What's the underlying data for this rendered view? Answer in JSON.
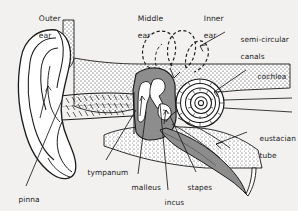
{
  "figure": {
    "kind": "anatomical-diagram",
    "background_color": "#f2f1ef",
    "ink_color": "#1b1b1b",
    "cavity_fill": "#8d8d8d",
    "bone_stipple_fill": "#d8d8d8",
    "bone_white_fill": "#ffffff"
  },
  "headings": [
    {
      "id": "outer",
      "line1": "Outer",
      "line2": "ear"
    },
    {
      "id": "middle",
      "line1": "Middle",
      "line2": "ear"
    },
    {
      "id": "inner",
      "line1": "Inner",
      "line2": "ear"
    }
  ],
  "labels": [
    {
      "id": "semicircular-canals",
      "line1": "semi-circular",
      "line2": "canals"
    },
    {
      "id": "cochlea",
      "line1": "cochlea",
      "line2": ""
    },
    {
      "id": "eustacian-tube",
      "line1": "eustacian",
      "line2": "tube"
    },
    {
      "id": "tympanum",
      "line1": "tympanum",
      "line2": ""
    },
    {
      "id": "malleus",
      "line1": "malleus",
      "line2": ""
    },
    {
      "id": "incus",
      "line1": "incus",
      "line2": ""
    },
    {
      "id": "stapes",
      "line1": "stapes",
      "line2": ""
    },
    {
      "id": "pinna",
      "line1": "pinna",
      "line2": ""
    }
  ]
}
